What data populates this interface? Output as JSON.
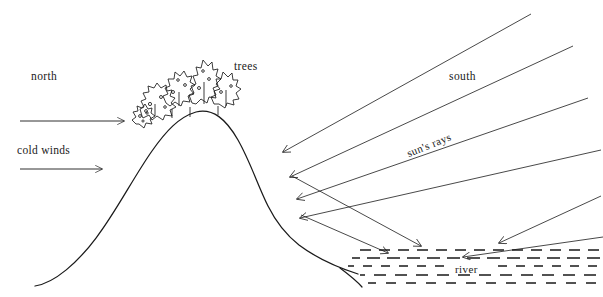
{
  "diagram": {
    "background_color": "#ffffff",
    "ink_color": "#1a1a1a",
    "labels": {
      "north": "north",
      "cold_winds": "cold  winds",
      "trees": "trees",
      "south": "south",
      "suns_rays": "sun's  rays",
      "river": "river"
    },
    "elements": {
      "hill": "hill-outline",
      "tree_cluster": "tree-cluster",
      "wind_arrows": 2,
      "sun_ray_lines": 5,
      "reflected_arrows": 4,
      "river_band": "river-hatching"
    }
  }
}
